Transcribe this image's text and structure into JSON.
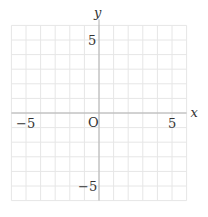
{
  "chart_data": {
    "type": "scatter",
    "title": "",
    "xlabel": "x",
    "ylabel": "y",
    "xlim": [
      -6,
      6
    ],
    "ylim": [
      -6,
      6
    ],
    "grid": true,
    "grid_step": 1,
    "origin_label": "O",
    "x_ticks": [
      {
        "value": -5,
        "label": "−5"
      },
      {
        "value": 5,
        "label": "5"
      }
    ],
    "y_ticks": [
      {
        "value": 5,
        "label": "5"
      },
      {
        "value": -5,
        "label": "−5"
      }
    ],
    "series": []
  },
  "colors": {
    "grid": "#e6e6e6",
    "axis": "#b0b0b0",
    "text": "#333333"
  }
}
